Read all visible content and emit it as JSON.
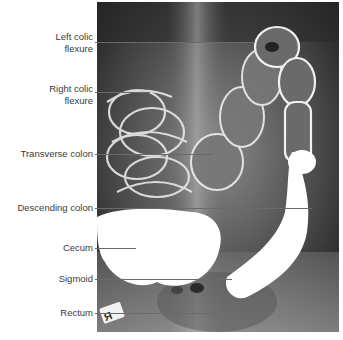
{
  "figure": {
    "type": "annotated-radiograph",
    "film_marker": "R",
    "labels": [
      {
        "text_lines": [
          "Left colic",
          "flexure"
        ],
        "y": 42,
        "line_end_x": 255
      },
      {
        "text_lines": [
          "Right colic",
          "flexure"
        ],
        "y": 92,
        "line_end_x": 150
      },
      {
        "text_lines": [
          "Transverse colon"
        ],
        "y": 154,
        "line_end_x": 213
      },
      {
        "text_lines": [
          "Descending colon"
        ],
        "y": 208,
        "line_end_x": 312
      },
      {
        "text_lines": [
          "Cecum"
        ],
        "y": 248,
        "line_end_x": 136
      },
      {
        "text_lines": [
          "Sigmoid"
        ],
        "y": 279,
        "line_end_x": 232
      },
      {
        "text_lines": [
          "Rectum"
        ],
        "y": 313,
        "line_end_x": 218
      }
    ],
    "colors": {
      "label_text": "#3a3a3a",
      "leader_line": "#6a6a6a",
      "xray_background": "#1a1a1a",
      "contrast_fill": "#ffffff"
    }
  }
}
